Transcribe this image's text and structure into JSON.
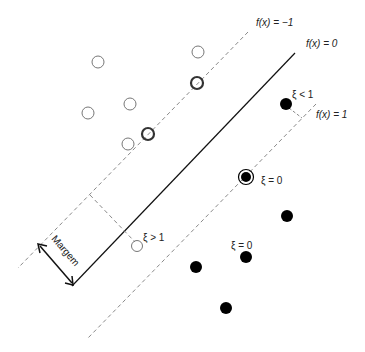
{
  "diagram": {
    "type": "svm-margin-illustration",
    "labels": {
      "hyperplane": "f(x) = 0",
      "neg_margin": "f(x) = −1",
      "pos_margin": "f(x) = 1",
      "margin": "Margem",
      "xi_lt_1": "ξ < 1",
      "xi_eq_0_sv": "ξ = 0",
      "xi_eq_0_pt": "ξ = 0",
      "xi_gt_1": "ξ > 1"
    },
    "colors": {
      "solid_line": "#111111",
      "dashed_line": "#888888",
      "open_point": "#777777",
      "filled_point": "#000000"
    },
    "lines": {
      "hyperplane": {
        "x1": 295,
        "y1": 53,
        "x2": 72,
        "y2": 286
      },
      "neg_margin": {
        "x1": 248,
        "y1": 32,
        "x2": 18,
        "y2": 268
      },
      "pos_margin": {
        "x1": 316,
        "y1": 104,
        "x2": 88,
        "y2": 338
      }
    },
    "open_points": [
      {
        "x": 98,
        "y": 62
      },
      {
        "x": 198,
        "y": 52
      },
      {
        "x": 130,
        "y": 104
      },
      {
        "x": 88,
        "y": 113
      },
      {
        "x": 128,
        "y": 144
      }
    ],
    "open_support_vectors": [
      {
        "x": 197,
        "y": 83
      },
      {
        "x": 148,
        "y": 134
      }
    ],
    "misclassified_open": {
      "x": 137,
      "y": 246
    },
    "filled_points": [
      {
        "x": 286,
        "y": 104
      },
      {
        "x": 287,
        "y": 216
      },
      {
        "x": 246,
        "y": 257
      },
      {
        "x": 196,
        "y": 267
      },
      {
        "x": 226,
        "y": 308
      }
    ],
    "filled_support_vector": {
      "x": 246,
      "y": 177
    }
  }
}
